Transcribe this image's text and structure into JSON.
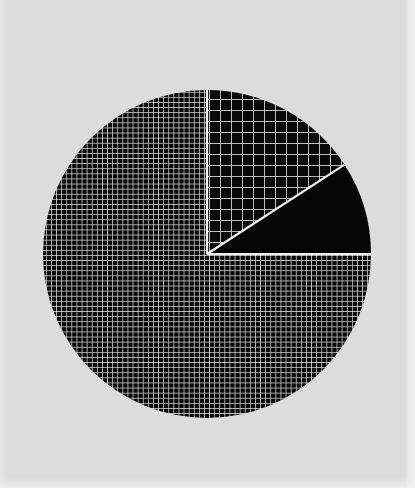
{
  "page": {
    "background_color": "#dcdcdc",
    "width": 415,
    "height": 488
  },
  "chart_data": {
    "type": "pie",
    "title": "",
    "subtitle": "",
    "xlabel": "",
    "ylabel": "",
    "grid": false,
    "legend": "none",
    "center": {
      "x": 207,
      "y": 254
    },
    "radius": 164,
    "start_angle_deg": 90,
    "direction": "counterclockwise",
    "total_degrees": 360,
    "categories": [
      "Slice 1",
      "Slice 2",
      "Slice 3"
    ],
    "values": [
      75.0,
      15.8,
      9.2
    ],
    "angles_deg": [
      270,
      57,
      33
    ],
    "labels": [
      "",
      "",
      ""
    ],
    "slices": [
      {
        "name": "Slice 1",
        "value": 75.0,
        "angle_deg": 270,
        "start_deg": 90,
        "end_deg": 360,
        "fill": "#0a0a0a",
        "hatch": "fine-crosshatch",
        "hatch_spacing_px": 5,
        "hatch_color": "#e8e8e8"
      },
      {
        "name": "Slice 2",
        "value": 15.8,
        "angle_deg": 57,
        "start_deg": 33,
        "end_deg": 90,
        "fill": "#0a0a0a",
        "hatch": "coarse-grid",
        "hatch_spacing_px": 11,
        "hatch_color": "#e8e8e8"
      },
      {
        "name": "Slice 3",
        "value": 9.2,
        "angle_deg": 33,
        "start_deg": 0,
        "end_deg": 33,
        "fill": "#050505",
        "hatch": "solid",
        "hatch_spacing_px": 0,
        "hatch_color": "none"
      }
    ],
    "colors": {
      "fill": "#0a0a0a",
      "hatch": "#e8e8e8",
      "background": "#dcdcdc",
      "separator": "#f0f0f0"
    }
  }
}
